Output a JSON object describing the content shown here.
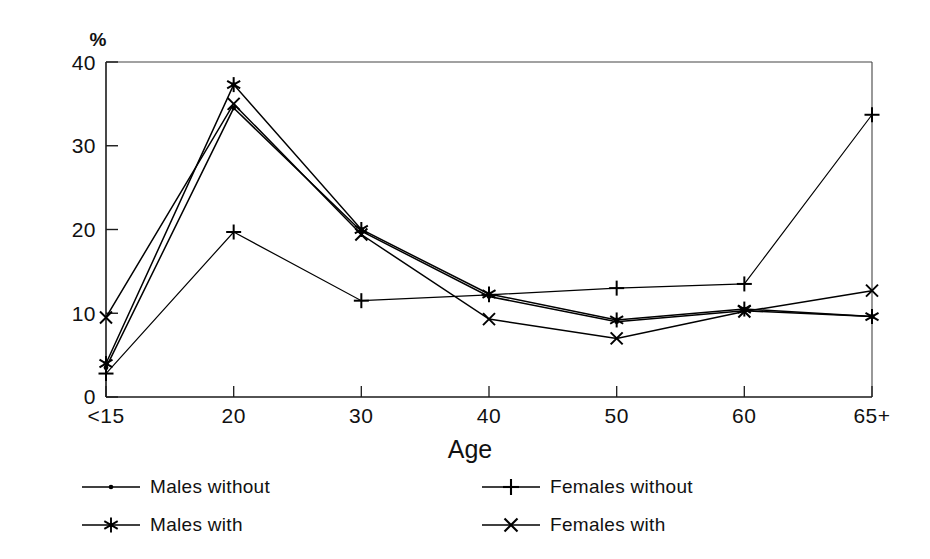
{
  "chart_data": {
    "type": "line",
    "title": "",
    "subtitle": "",
    "xlabel": "Age",
    "ylabel": "%",
    "ylabel_position": "above-axis",
    "categories": [
      "<15",
      "20",
      "30",
      "40",
      "50",
      "60",
      "65+"
    ],
    "x_tick_labels": [
      "<15",
      "20",
      "30",
      "40",
      "50",
      "60",
      "65+"
    ],
    "y_tick_labels": [
      "0",
      "10",
      "20",
      "30",
      "40"
    ],
    "y_ticks": [
      0,
      10,
      20,
      30,
      40
    ],
    "ylim": [
      0,
      40
    ],
    "grid": false,
    "legend_position": "below-plot-two-columns",
    "series": [
      {
        "name": "Males without",
        "marker": "dot",
        "color": "#000000",
        "values": [
          3.5,
          34.5,
          19.8,
          12.0,
          9.0,
          10.3,
          9.6
        ]
      },
      {
        "name": "Males with",
        "marker": "star",
        "color": "#000000",
        "values": [
          4.0,
          37.3,
          20.0,
          12.3,
          9.2,
          10.5,
          9.6
        ]
      },
      {
        "name": "Females without",
        "marker": "plus",
        "color": "#000000",
        "values": [
          2.8,
          19.7,
          11.5,
          12.2,
          13.0,
          13.5,
          33.7
        ]
      },
      {
        "name": "Females with",
        "marker": "cross",
        "color": "#000000",
        "values": [
          9.5,
          35.0,
          19.4,
          9.3,
          7.0,
          10.2,
          12.7
        ]
      }
    ]
  },
  "axes": {
    "y_unit_label": "%",
    "x_axis_title": "Age"
  },
  "legend": {
    "columns": [
      {
        "entries": [
          {
            "label": "Males without",
            "marker": "dot"
          },
          {
            "label": "Males with",
            "marker": "star"
          }
        ]
      },
      {
        "entries": [
          {
            "label": "Females without",
            "marker": "plus"
          },
          {
            "label": "Females with",
            "marker": "cross"
          }
        ]
      }
    ]
  }
}
